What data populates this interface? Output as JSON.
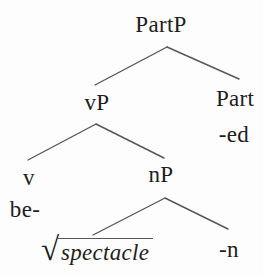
{
  "figure": {
    "type": "syntax-tree",
    "background_color": "#fdfdfd",
    "line_color": "#565656",
    "text_color": "#1e1e1e"
  },
  "nodes": {
    "root_phrase": "PartP",
    "vp": "vP",
    "part_head": "Part",
    "part_suffix": "-ed",
    "v_head": "v",
    "v_prefix": "be-",
    "np": "nP",
    "radical_sign": "√",
    "root_morpheme": "spectacle",
    "n_suffix": "-n"
  }
}
